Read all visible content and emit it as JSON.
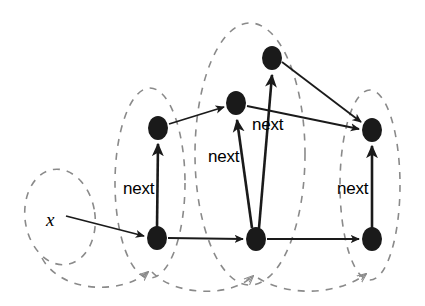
{
  "figure": {
    "type": "object-graph-diagram",
    "background": "#ffffff",
    "width": 425,
    "height": 306
  },
  "style": {
    "node_fill": "#1a1a1a",
    "edge_color": "#1a1a1a",
    "region_color": "#8a8a8a",
    "text_color": "#000000"
  },
  "variables": [
    {
      "id": "x",
      "label": "x",
      "x": 50,
      "y": 219
    }
  ],
  "nodes": [
    {
      "id": "n1-bottom",
      "x": 157,
      "y": 238,
      "rx": 10,
      "ry": 12
    },
    {
      "id": "n1-top",
      "x": 158,
      "y": 128,
      "rx": 10,
      "ry": 12
    },
    {
      "id": "n2-bottom",
      "x": 256,
      "y": 239,
      "rx": 10,
      "ry": 12
    },
    {
      "id": "n2-top",
      "x": 236,
      "y": 103,
      "rx": 10,
      "ry": 12
    },
    {
      "id": "n3-top",
      "x": 272,
      "y": 58,
      "rx": 10,
      "ry": 12
    },
    {
      "id": "n4-bottom",
      "x": 372,
      "y": 239,
      "rx": 10,
      "ry": 12
    },
    {
      "id": "n4-top",
      "x": 372,
      "y": 130,
      "rx": 10,
      "ry": 12
    }
  ],
  "edges": [
    {
      "id": "e-x-n1",
      "from": "x",
      "to": "n1-bottom",
      "label": ""
    },
    {
      "id": "e-n1b-n1t",
      "from": "n1-bottom",
      "to": "n1-top",
      "label": "next"
    },
    {
      "id": "e-n1b-n2b",
      "from": "n1-bottom",
      "to": "n2-bottom",
      "label": ""
    },
    {
      "id": "e-n1t-n2t",
      "from": "n1-top",
      "to": "n2-top",
      "label": ""
    },
    {
      "id": "e-n2b-n2t",
      "from": "n2-bottom",
      "to": "n2-top",
      "label": "next"
    },
    {
      "id": "e-n2b-n3t",
      "from": "n2-bottom",
      "to": "n3-top",
      "label": "next"
    },
    {
      "id": "e-n2b-n4b",
      "from": "n2-bottom",
      "to": "n4-bottom",
      "label": ""
    },
    {
      "id": "e-n2t-n4t",
      "from": "n2-top",
      "to": "n4-top",
      "label": ""
    },
    {
      "id": "e-n3t-n4t",
      "from": "n3-top",
      "to": "n4-top",
      "label": ""
    },
    {
      "id": "e-n4b-n4t",
      "from": "n4-bottom",
      "to": "n4-top",
      "label": "next"
    }
  ],
  "edge_labels": [
    {
      "id": "label-next-1",
      "text": "next",
      "x": 123,
      "y": 188
    },
    {
      "id": "label-next-2",
      "text": "next",
      "x": 212,
      "y": 157
    },
    {
      "id": "label-next-3",
      "text": "next",
      "x": 253,
      "y": 123
    },
    {
      "id": "label-next-4",
      "text": "next",
      "x": 337,
      "y": 188
    }
  ],
  "regions": [
    {
      "id": "region-1",
      "cx": 60,
      "cy": 217,
      "rx": 35,
      "ry": 48,
      "rotate": -8
    },
    {
      "id": "region-2",
      "cx": 150,
      "cy": 183,
      "rx": 35,
      "ry": 95,
      "rotate": 0
    },
    {
      "id": "region-3",
      "cx": 250,
      "cy": 154,
      "rx": 55,
      "ry": 131,
      "rotate": 0
    },
    {
      "id": "region-4",
      "cx": 370,
      "cy": 185,
      "rx": 30,
      "ry": 95,
      "rotate": 0
    }
  ],
  "region_links": [
    {
      "id": "region-link-1",
      "from": "region-1",
      "to": "region-2"
    },
    {
      "id": "region-link-2",
      "from": "region-2",
      "to": "region-3"
    },
    {
      "id": "region-link-3",
      "from": "region-3",
      "to": "region-4"
    }
  ]
}
